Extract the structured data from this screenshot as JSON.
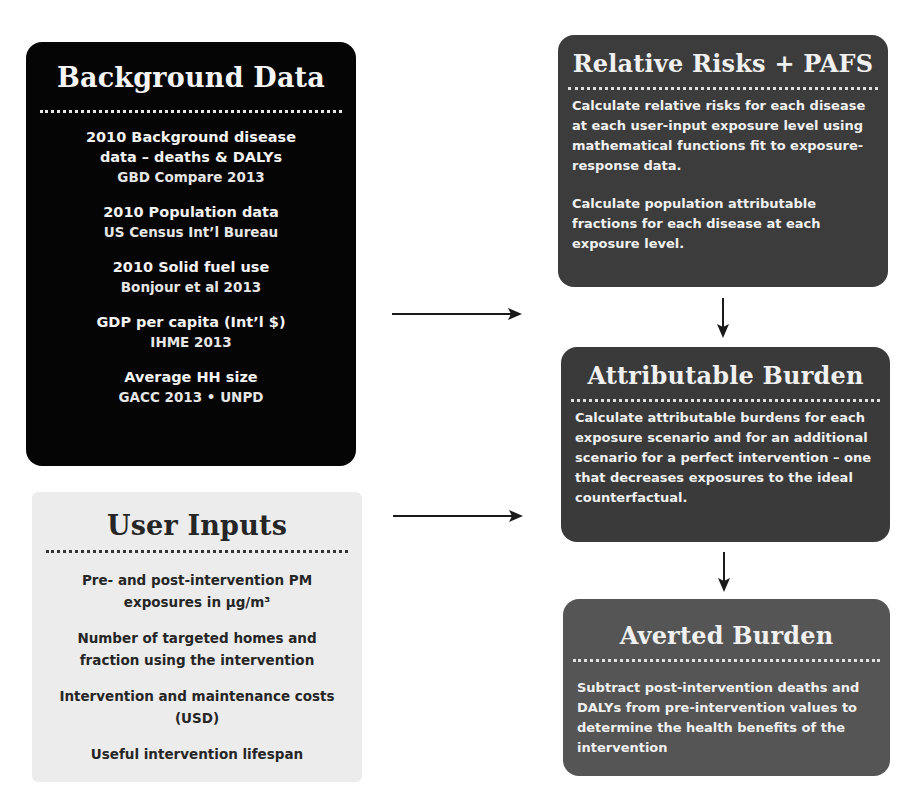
{
  "background_data": {
    "title": "Background Data",
    "items": [
      {
        "title_line1": "2010 Background disease",
        "title_line2": "data – deaths & DALYs",
        "source": "GBD Compare 2013"
      },
      {
        "title_line1": "2010 Population data",
        "title_line2": "",
        "source": "US Census Int’l Bureau"
      },
      {
        "title_line1": "2010 Solid fuel use",
        "title_line2": "",
        "source": "Bonjour et al 2013"
      },
      {
        "title_line1": "GDP per capita (Int’l $)",
        "title_line2": "",
        "source": "IHME 2013"
      },
      {
        "title_line1": "Average HH size",
        "title_line2": "",
        "source": "GACC 2013 • UNPD"
      }
    ]
  },
  "user_inputs": {
    "title": "User Inputs",
    "items": [
      "Pre- and post-intervention PM exposures in µg/m³",
      "Number of targeted homes and fraction using the intervention",
      "Intervention and maintenance costs (USD)",
      "Useful intervention lifespan"
    ]
  },
  "relative_risks": {
    "title": "Relative Risks + PAFS",
    "paragraphs": [
      "Calculate relative risks for each disease at each user-input exposure level using mathematical functions fit to exposure-response data.",
      "Calculate population attributable fractions for each disease at each exposure level."
    ]
  },
  "attributable_burden": {
    "title": "Attributable Burden",
    "paragraphs": [
      "Calculate attributable burdens for each exposure scenario and for an additional scenario for a perfect intervention – one that decreases exposures to the ideal counterfactual."
    ]
  },
  "averted_burden": {
    "title": "Averted Burden",
    "paragraphs": [
      "Subtract post-intervention deaths and DALYs from pre-intervention values to determine the health benefits of the intervention"
    ]
  },
  "colors": {
    "background_box": "#050505",
    "user_inputs_box": "#ececec",
    "process_box": "#3c3c3c",
    "averted_box": "#555555",
    "arrow": "#1a1a1a"
  }
}
